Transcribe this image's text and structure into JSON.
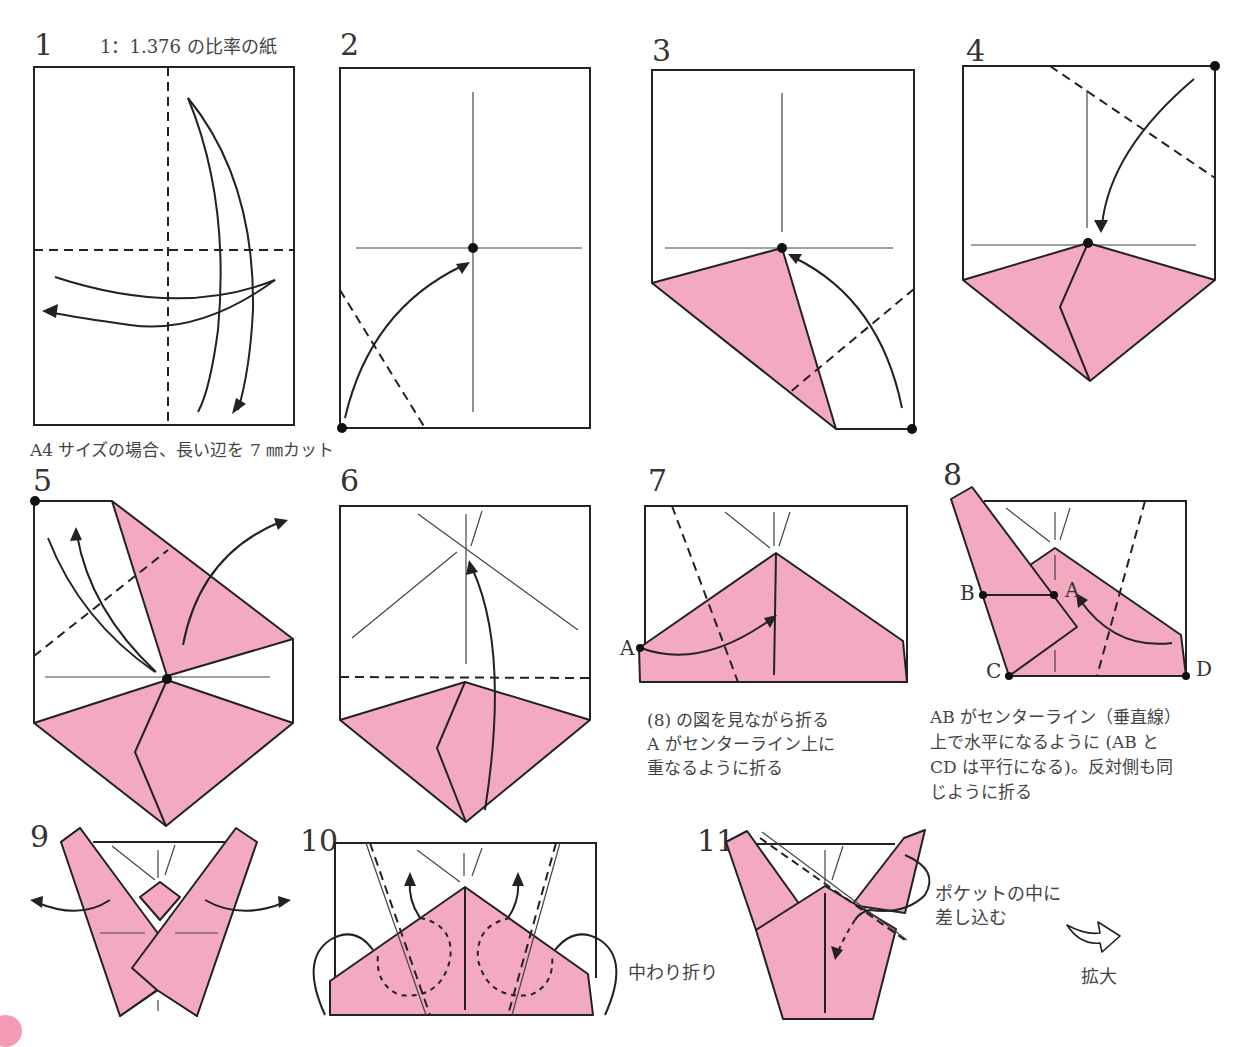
{
  "colors": {
    "paper_pink": "#f3a9bf",
    "line": "#222222",
    "text": "#333333"
  },
  "steps": [
    {
      "number": "1",
      "note": "1：1.376 の比率の紙",
      "caption": "A4 サイズの場合、長い辺を 7 ㎜カット"
    },
    {
      "number": "2"
    },
    {
      "number": "3"
    },
    {
      "number": "4"
    },
    {
      "number": "5"
    },
    {
      "number": "6"
    },
    {
      "number": "7",
      "point_label": "A",
      "caption_lines": [
        "(8) の図を見ながら折る",
        "A がセンターライン上に",
        "重なるように折る"
      ]
    },
    {
      "number": "8",
      "point_labels": [
        "B",
        "A",
        "C",
        "D"
      ],
      "caption_lines": [
        "AB がセンターライン（垂直線）",
        "上で水平になるように (AB と",
        "CD は平行になる)。反対側も同",
        "じように折る"
      ]
    },
    {
      "number": "9"
    },
    {
      "number": "10",
      "note": "中わり折り"
    },
    {
      "number": "11",
      "note_lines": [
        "ポケットの中に",
        "差し込む"
      ],
      "enlarge_label": "拡大"
    }
  ]
}
